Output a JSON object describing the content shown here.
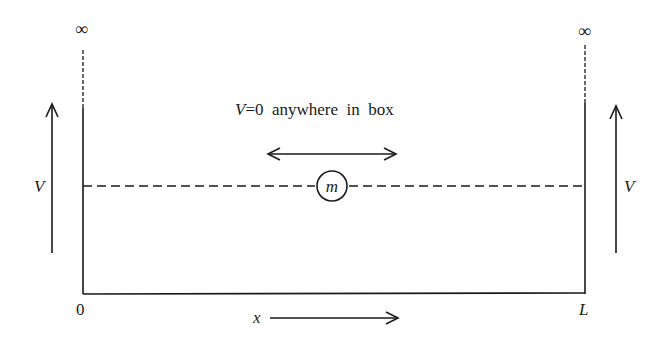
{
  "diagram": {
    "title_label": "V=0 anywhere in box",
    "title_parts": {
      "var": "V",
      "rest": "=0  anywhere  in  box"
    },
    "left_wall": {
      "top_label": "∞",
      "potential_label": "V",
      "position_label": "0"
    },
    "right_wall": {
      "top_label": "∞",
      "potential_label": "V",
      "position_label": "L"
    },
    "particle": {
      "label": "m"
    },
    "x_axis": {
      "label": "x"
    },
    "colors": {
      "ink": "#1a1a1a",
      "background": "#ffffff"
    }
  }
}
